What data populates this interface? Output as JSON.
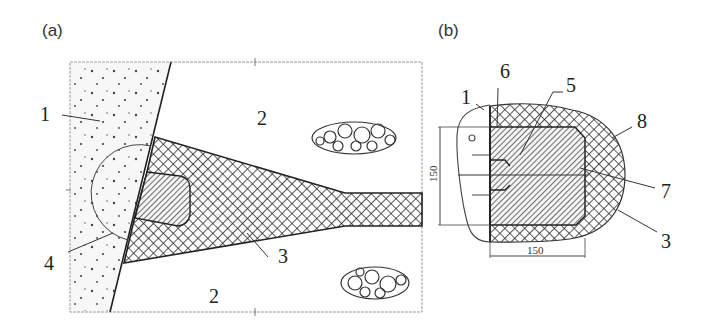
{
  "figure": {
    "panel_a": {
      "label": "(a)",
      "callouts": [
        {
          "id": "1",
          "text": "1"
        },
        {
          "id": "2-top",
          "text": "2"
        },
        {
          "id": "2-bottom",
          "text": "2"
        },
        {
          "id": "3",
          "text": "3"
        },
        {
          "id": "4",
          "text": "4"
        }
      ]
    },
    "panel_b": {
      "label": "(b)",
      "callouts": [
        {
          "id": "1",
          "text": "1"
        },
        {
          "id": "6",
          "text": "6"
        },
        {
          "id": "5",
          "text": "5"
        },
        {
          "id": "8",
          "text": "8"
        },
        {
          "id": "7",
          "text": "7"
        },
        {
          "id": "3",
          "text": "3"
        }
      ],
      "dimensions": {
        "height": "150",
        "width": "150"
      }
    },
    "colors": {
      "line": "#222222",
      "frame": "#9a9a9a",
      "stipple": "#444444",
      "background": "#ffffff"
    }
  }
}
